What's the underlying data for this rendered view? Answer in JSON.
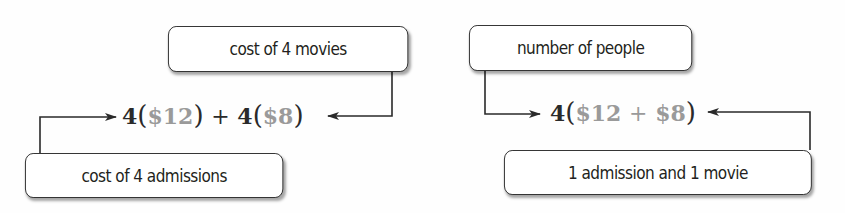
{
  "left_diagram": {
    "top_label": "cost of 4 movies",
    "bottom_label": "cost of 4 admissions",
    "expression": {
      "coef1": "4",
      "val1": "$12",
      "plus": "+",
      "coef2": "4",
      "val2": "$8"
    }
  },
  "right_diagram": {
    "top_label": "number of people",
    "bottom_label": "1 admission and 1 movie",
    "expression": {
      "coef": "4",
      "val1": "$12",
      "plus": "+",
      "val2": "$8"
    }
  },
  "colors": {
    "ink": "#2a2a2a",
    "gray_values": "#9a9a9a"
  }
}
